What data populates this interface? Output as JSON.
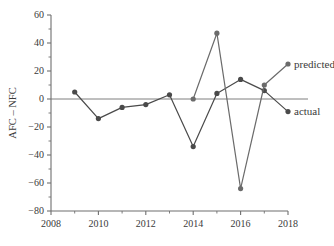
{
  "chart_data": {
    "type": "line",
    "title": "",
    "xlabel": "",
    "ylabel": "AFC – NFC",
    "xlim": [
      2008,
      2018
    ],
    "ylim": [
      -80,
      60
    ],
    "ytick_values": [
      60,
      40,
      20,
      0,
      -20,
      -40,
      -60,
      -80
    ],
    "ytick_labels": [
      "60",
      "40",
      "20",
      "0",
      "−20",
      "−40",
      "−60",
      "−80"
    ],
    "xtick_values": [
      2008,
      2010,
      2012,
      2014,
      2016,
      2018
    ],
    "xtick_labels": [
      "2008",
      "2010",
      "2012",
      "2014",
      "2016",
      "2018"
    ],
    "xminor_values": [
      2009,
      2011,
      2013,
      2015,
      2017
    ],
    "grid": false,
    "zero_line": true,
    "legend_position": "inline-right",
    "series": [
      {
        "name": "actual",
        "label": "actual",
        "color": "#4a4a4a",
        "marker": "circle",
        "x": [
          2009,
          2010,
          2011,
          2012,
          2013,
          2014,
          2015,
          2016,
          2017,
          2018
        ],
        "values": [
          5,
          -14,
          -6,
          -4,
          3,
          -34,
          4,
          14,
          6,
          -9
        ]
      },
      {
        "name": "predicted",
        "label": "predicted",
        "color": "#6b6b6b",
        "marker": "circle",
        "x": [
          2014,
          2015,
          2016,
          2017,
          2018
        ],
        "values": [
          0,
          47,
          -64,
          10,
          25
        ]
      }
    ]
  },
  "labels": {
    "ylabel": "AFC – NFC",
    "predicted": "predicted",
    "actual": "actual"
  },
  "colors": {
    "axis": "#6f6f6f",
    "actual": "#4a4a4a",
    "predicted": "#6b6b6b",
    "text": "#3a3a3a",
    "background": "#ffffff"
  }
}
